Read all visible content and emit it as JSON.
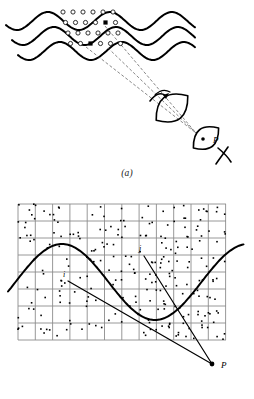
{
  "figure": {
    "panels": [
      {
        "id": "a",
        "caption": "(a)",
        "description": "wavefronts with scattering centers and observer eye",
        "labels": [
          {
            "name": "point-p",
            "text": "P",
            "x": 213,
            "y": 143
          }
        ],
        "wavefronts": {
          "count": 3,
          "color": "#000000",
          "stroke_width": 2.0,
          "x_start": 6,
          "x_end": 196,
          "amplitude": 9,
          "wavelength": 62,
          "y_positions": [
            21,
            36,
            51
          ],
          "row_dx": 6
        },
        "scatterers": {
          "open_marker": "circle",
          "open_color": "#ffffff",
          "open_edge": "#000000",
          "open_radius": 2.1,
          "filled_marker": "square",
          "filled_color": "#000000",
          "filled_count": 2,
          "columns": 6,
          "rows": 4,
          "col_spacing": 10,
          "row_spacing": 10.5,
          "origin_x": 63,
          "origin_y": 12
        },
        "rays": {
          "style": "dashed",
          "color": "#555555",
          "stroke_width": 0.7,
          "dash": "3,2",
          "count": 3,
          "converge_x": 196,
          "converge_y": 133
        },
        "eye": {
          "lens_big": {
            "cx": 172,
            "cy": 108,
            "rx": 20,
            "ry": 15,
            "angle": -38
          },
          "lens_small": {
            "cx": 206,
            "cy": 138,
            "rx": 16,
            "ry": 12,
            "angle": -38
          },
          "stroke": "#000000",
          "stroke_width": 1.6,
          "pupil_dot_x": 203,
          "pupil_dot_y": 139
        }
      },
      {
        "id": "b",
        "caption": "(b)",
        "description": "grid mesh with random dot field, smooth curve and two rays converging at P",
        "labels": [
          {
            "name": "point-p",
            "text": "P",
            "x": 221,
            "y": 368
          },
          {
            "name": "ray-i",
            "text": "i",
            "x": 63,
            "y": 277
          },
          {
            "name": "ray-j",
            "text": "j",
            "x": 139,
            "y": 251
          }
        ],
        "grid": {
          "color": "#8c8c8c",
          "stroke_width": 0.9,
          "x_min": 18,
          "x_max": 226,
          "y_min": 204,
          "y_max": 340,
          "v_count": 13,
          "h_count": 9,
          "v_spacing": 17.3,
          "h_spacing": 17.0
        },
        "dot_field": {
          "color": "#000000",
          "marker": "square",
          "size": 1.6,
          "count": 250,
          "seed": 7
        },
        "curve": {
          "color": "#000000",
          "stroke_width": 2.0,
          "type": "sine-like",
          "x_start": 8,
          "x_end": 244,
          "peak_x": 62,
          "peak_y": 244,
          "trough_x": 155,
          "trough_y": 320
        },
        "rays": [
          {
            "name": "ray-i",
            "x1": 68,
            "y1": 281,
            "x2": 212,
            "y2": 364,
            "stroke_width": 1.2
          },
          {
            "name": "ray-j",
            "x1": 144,
            "y1": 256,
            "x2": 212,
            "y2": 364,
            "stroke_width": 1.2
          }
        ],
        "point_p": {
          "x": 212,
          "y": 364,
          "radius": 2.4,
          "color": "#000000"
        }
      }
    ]
  }
}
